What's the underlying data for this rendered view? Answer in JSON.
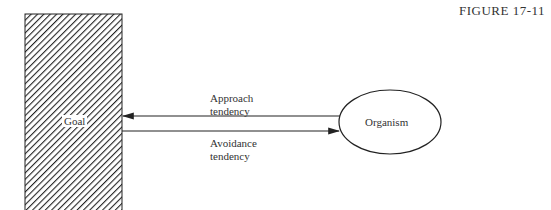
{
  "figure_label": "FIGURE 17-11",
  "goal": {
    "label": "Goal"
  },
  "organism": {
    "label": "Organism"
  },
  "arrows": {
    "approach": {
      "line1": "Approach",
      "line2": "tendency",
      "direction": "toward-goal"
    },
    "avoidance": {
      "line1": "Avoidance",
      "line2": "tendency",
      "direction": "toward-organism"
    }
  }
}
